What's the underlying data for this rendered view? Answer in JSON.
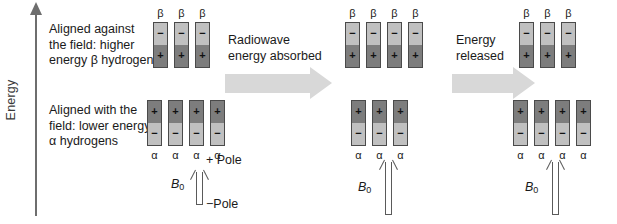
{
  "figure": {
    "axis": {
      "label": "Energy"
    },
    "captions": {
      "beta": "Aligned against\nthe field: higher\nenergy β hydrogens",
      "alpha": "Aligned with the\nfield: lower energy\nα hydrogens"
    },
    "steps": [
      {
        "label": "Radiowave\nenergy absorbed",
        "arrow": "right-block-arrow"
      },
      {
        "label": "Energy\nreleased",
        "arrow": "right-block-arrow"
      }
    ],
    "states": [
      {
        "name": "initial-state",
        "beta": {
          "count": 3,
          "tag": "β",
          "top_sign": "−",
          "bottom_sign": "+",
          "top_shade": "light",
          "bottom_shade": "dark"
        },
        "alpha": {
          "count": 4,
          "tag": "α",
          "top_sign": "+",
          "bottom_sign": "−",
          "top_shade": "dark",
          "bottom_shade": "light"
        },
        "field": {
          "symbol": "B",
          "subscript": "0",
          "plus_pole": "+ Pole",
          "minus_pole": "−Pole"
        }
      },
      {
        "name": "excited-state",
        "beta": {
          "count": 4,
          "tag": "β",
          "top_sign": "−",
          "bottom_sign": "+",
          "top_shade": "light",
          "bottom_shade": "dark"
        },
        "alpha": {
          "count": 3,
          "tag": "α",
          "top_sign": "+",
          "bottom_sign": "−",
          "top_shade": "dark",
          "bottom_shade": "light"
        },
        "field": {
          "symbol": "B",
          "subscript": "0",
          "plus_pole": "",
          "minus_pole": ""
        }
      },
      {
        "name": "relaxed-state",
        "beta": {
          "count": 3,
          "tag": "β",
          "top_sign": "−",
          "bottom_sign": "+",
          "top_shade": "light",
          "bottom_shade": "dark"
        },
        "alpha": {
          "count": 4,
          "tag": "α",
          "top_sign": "+",
          "bottom_sign": "−",
          "top_shade": "dark",
          "bottom_shade": "light"
        },
        "field": {
          "symbol": "B",
          "subscript": "0",
          "plus_pole": "",
          "minus_pole": ""
        }
      }
    ],
    "colors": {
      "bar_dark": "#7d7d7d",
      "bar_light": "#c0c0c0",
      "bar_border": "#4a4a4a",
      "block_arrow": "#d8d8d8",
      "axis": "#6e6e6e",
      "text": "#1a1a1a"
    }
  }
}
